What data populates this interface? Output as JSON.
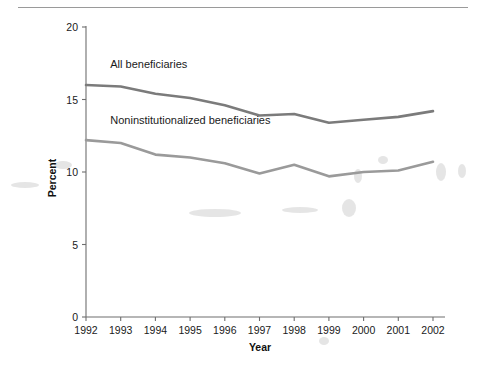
{
  "chart_data": {
    "type": "line",
    "title": "",
    "subtitle": "",
    "xlabel": "Year",
    "ylabel": "Percent",
    "categories": [
      "1992",
      "1993",
      "1994",
      "1995",
      "1996",
      "1997",
      "1998",
      "1999",
      "2000",
      "2001",
      "2002"
    ],
    "x": [
      1992,
      1993,
      1994,
      1995,
      1996,
      1997,
      1998,
      1999,
      2000,
      2001,
      2002
    ],
    "xlim": [
      1992,
      2002
    ],
    "ylim": [
      0,
      20
    ],
    "yticks": [
      0,
      5,
      10,
      15,
      20
    ],
    "ytick_labels": [
      "0",
      "5",
      "10",
      "15",
      "20"
    ],
    "xticks": [
      1992,
      1993,
      1994,
      1995,
      1996,
      1997,
      1998,
      1999,
      2000,
      2001,
      2002
    ],
    "grid": false,
    "legend_position": "inline-annotations",
    "series": [
      {
        "name": "All beneficiaries",
        "color": "#7b7b7b",
        "values": [
          16.0,
          15.9,
          15.4,
          15.1,
          14.6,
          13.9,
          14.0,
          13.4,
          13.6,
          13.8,
          14.2
        ]
      },
      {
        "name": "Noninstitutionalized beneficiaries",
        "color": "#9a9a9a",
        "values": [
          12.2,
          12.0,
          11.2,
          11.0,
          10.6,
          9.9,
          10.5,
          9.7,
          10.0,
          10.1,
          10.7
        ]
      }
    ],
    "annotations": [
      {
        "text": "All beneficiaries",
        "x": 1992.7,
        "y": 17.2
      },
      {
        "text": "Noninstitutionalized beneficiaries",
        "x": 1992.7,
        "y": 13.3
      }
    ]
  },
  "axes": {
    "y_title": "Percent",
    "x_title": "Year"
  },
  "colors": {
    "background": "#ffffff",
    "axis": "#6e6e6e",
    "text": "#1a1a1a",
    "series_all": "#7b7b7b",
    "series_noninst": "#9a9a9a",
    "top_rule": "#9a9a9a"
  }
}
